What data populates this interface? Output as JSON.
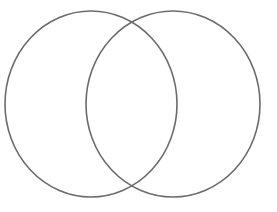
{
  "document": {
    "title": "Two Intersecting Circles",
    "background_color": "#ffffff",
    "width": 277,
    "height": 212
  },
  "figure": {
    "name": "two-intersecting-circles",
    "description": "Line drawing of two overlapping circles forming a two-set Venn diagram outline",
    "stroke_color": "#6b6b6b",
    "stroke_width": 1.6,
    "fill": "none",
    "labels": [],
    "shapes": [
      {
        "name": "left-circle",
        "type": "ellipse",
        "cx": 91,
        "cy": 104,
        "rx": 86,
        "ry": 93
      },
      {
        "name": "right-circle",
        "type": "ellipse",
        "cx": 173,
        "cy": 104,
        "rx": 87,
        "ry": 93
      }
    ],
    "intersections": [
      {
        "name": "top-intersection",
        "x": 132,
        "y": 19
      },
      {
        "name": "bottom-intersection",
        "x": 132,
        "y": 190
      }
    ]
  }
}
